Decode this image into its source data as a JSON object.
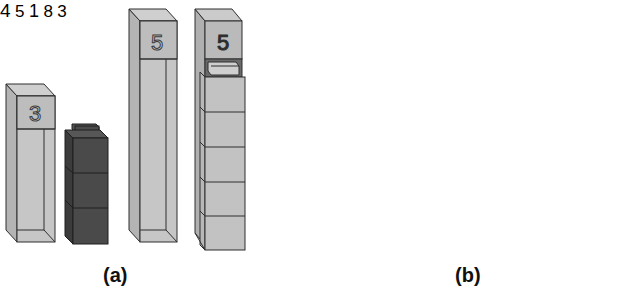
{
  "figure": {
    "panels": [
      {
        "id": "a",
        "caption": "(a)",
        "items": [
          {
            "type": "number-rod-tray",
            "label": "3",
            "contents": "empty"
          },
          {
            "type": "cube-stack",
            "count": 3,
            "color": "dark"
          },
          {
            "type": "number-rod-tray",
            "label": "5",
            "contents": "empty"
          },
          {
            "type": "number-rod-tray",
            "label": "5",
            "contents": "5 light cubes"
          }
        ]
      },
      {
        "id": "b",
        "caption": "(b)",
        "items": [
          {
            "type": "cube-tower",
            "label": "4",
            "cubes": [
              "light",
              "light",
              "dark",
              "light"
            ]
          },
          {
            "type": "cube",
            "color": "light"
          },
          {
            "type": "cube",
            "color": "dark"
          },
          {
            "type": "number-tag",
            "label": "5"
          },
          {
            "type": "labeled-cube",
            "label": "1",
            "color": "white"
          },
          {
            "type": "cube",
            "color": "dark"
          },
          {
            "type": "number-tag",
            "label": "8"
          },
          {
            "type": "number-tag",
            "label": "3"
          },
          {
            "type": "cube",
            "color": "medium"
          }
        ]
      }
    ],
    "labels": {
      "a_rod_1": "3",
      "a_rod_2": "5",
      "a_rod_3": "5",
      "b_tower": "4",
      "b_cube_1": "1",
      "b_tag_5": "5",
      "b_tag_8": "8",
      "b_tag_3": "3",
      "caption_a": "(a)",
      "caption_b": "(b)"
    },
    "colors": {
      "light": "#c4c4c4",
      "light_side": "#b0b0b0",
      "medium": "#a8a8a8",
      "dark": "#4a4a4a",
      "dark_side": "#3a3a3a",
      "white_cube": "#e8e8e8",
      "outline": "#2e2e2e"
    }
  }
}
